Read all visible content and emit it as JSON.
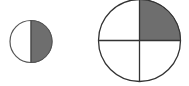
{
  "diagram": {
    "colors": {
      "stroke": "#333333",
      "shade": "#6e6e6e",
      "background": "#ffffff"
    },
    "shapes": [
      {
        "name": "half-circle",
        "cx": 31,
        "cy": 41.5,
        "r": 21,
        "parts": 2,
        "shaded_parts": 1,
        "fraction": "1/2"
      },
      {
        "name": "quarter-circle",
        "cx": 139.5,
        "cy": 40.5,
        "r": 41,
        "parts": 4,
        "shaded_parts": 1,
        "fraction": "1/4"
      }
    ]
  }
}
